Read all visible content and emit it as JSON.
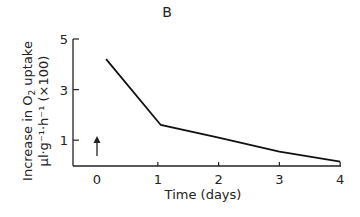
{
  "panel_label": "B",
  "chart_data": {
    "type": "line",
    "title": "B",
    "xlabel": "Time (days)",
    "ylabel_line1": "Increase in O2 uptake",
    "ylabel_line2": "µl·g⁻¹·h⁻¹ (×100)",
    "x_ticks": [
      "0",
      "1",
      "2",
      "3",
      "4"
    ],
    "y_ticks": [
      "1",
      "3",
      "5"
    ],
    "xlim": [
      -0.4,
      4
    ],
    "ylim": [
      0,
      5
    ],
    "grid": false,
    "series": [
      {
        "name": "O2 uptake increase",
        "x": [
          0.15,
          1.05,
          2,
          3,
          4
        ],
        "y": [
          4.2,
          1.6,
          1.1,
          0.55,
          0.15
        ]
      }
    ],
    "annotations": [
      {
        "type": "arrow",
        "x": 0,
        "y_from": 0.4,
        "y_to": 1.2,
        "direction": "up",
        "meaning": "treatment time point"
      }
    ]
  }
}
